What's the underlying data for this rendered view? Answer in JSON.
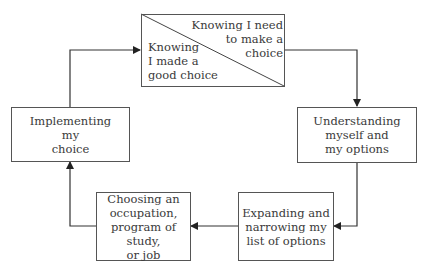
{
  "diagram": {
    "type": "cycle-flowchart",
    "nodes": [
      {
        "id": "top",
        "split": true,
        "upper_right_text": "Knowing I need\nto make a\nchoice",
        "lower_left_text": "Knowing\nI made a\ngood choice"
      },
      {
        "id": "right",
        "text": "Understanding\nmyself and\nmy options"
      },
      {
        "id": "bottom_right",
        "text": "Expanding and\nnarrowing my\nlist of options"
      },
      {
        "id": "bottom_left",
        "text": "Choosing an\noccupation,\nprogram of study,\nor job"
      },
      {
        "id": "left",
        "text": "Implementing\nmy\nchoice"
      }
    ],
    "edges": [
      {
        "from": "top",
        "to": "right"
      },
      {
        "from": "right",
        "to": "bottom_right"
      },
      {
        "from": "bottom_right",
        "to": "bottom_left"
      },
      {
        "from": "bottom_left",
        "to": "left"
      },
      {
        "from": "left",
        "to": "top"
      }
    ]
  }
}
